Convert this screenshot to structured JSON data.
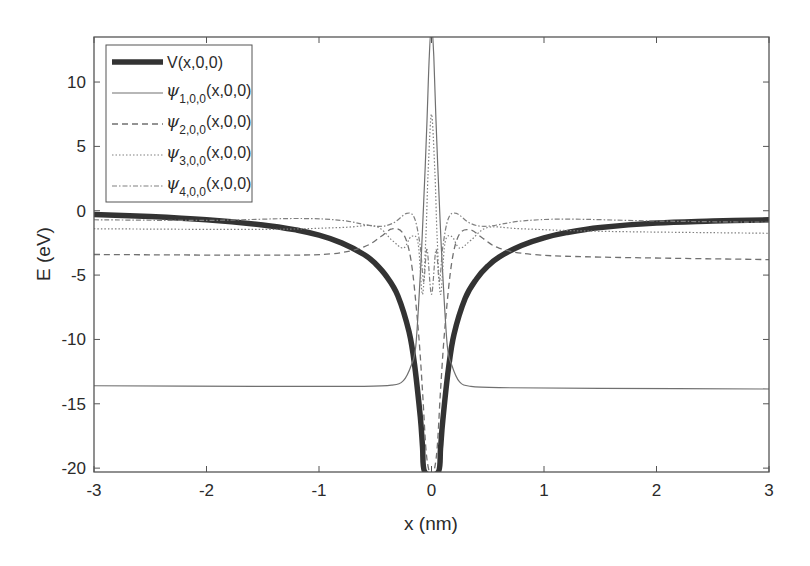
{
  "chart_data": {
    "type": "line",
    "title": "",
    "xlabel": "x (nm)",
    "ylabel": "E (eV)",
    "xlim": [
      -3,
      3
    ],
    "ylim": [
      -20.3,
      13.5
    ],
    "xticks": [
      -3,
      -2,
      -1,
      0,
      1,
      2,
      3
    ],
    "xtick_labels": [
      "-3",
      "-2",
      "-1",
      "0",
      "1",
      "2",
      "3"
    ],
    "yticks": [
      10,
      5,
      0,
      -5,
      -10,
      -15,
      -20
    ],
    "ytick_labels": [
      "10",
      "5",
      "0",
      "-5",
      "-10",
      "-15",
      "-20"
    ],
    "grid": false,
    "legend_position": "upper left",
    "series": [
      {
        "name": "V(x,0,0)",
        "legend_main": "V(x,0,0)",
        "style": "solid-thick",
        "color": "#333333",
        "x": [
          -3,
          -2.5,
          -2,
          -1.5,
          -1.2,
          -1.0,
          -0.8,
          -0.6,
          -0.5,
          -0.4,
          -0.3,
          -0.2,
          -0.15,
          -0.1,
          -0.08,
          -0.06,
          0.06,
          0.08,
          0.1,
          0.15,
          0.2,
          0.3,
          0.4,
          0.5,
          0.6,
          0.8,
          1.0,
          1.2,
          1.5,
          2,
          2.5,
          3
        ],
        "y": [
          -0.3,
          -0.45,
          -0.7,
          -1.1,
          -1.5,
          -1.9,
          -2.5,
          -3.4,
          -4.1,
          -5.1,
          -6.6,
          -9.4,
          -12.0,
          -16.0,
          -18.3,
          -20.3,
          -20.3,
          -18.5,
          -16.3,
          -12.3,
          -9.6,
          -6.8,
          -5.3,
          -4.3,
          -3.6,
          -2.7,
          -2.1,
          -1.7,
          -1.3,
          -0.95,
          -0.8,
          -0.7
        ]
      },
      {
        "name": "psi_1,0,0(x,0,0)",
        "legend_psi": "ψ",
        "legend_sub": "1,0,0",
        "legend_tail": "(x,0,0)",
        "style": "solid-thin",
        "color": "#707070",
        "x": [
          -3,
          -1.5,
          -0.6,
          -0.35,
          -0.25,
          -0.18,
          -0.14,
          -0.1,
          -0.07,
          -0.04,
          -0.02,
          0,
          0.02,
          0.04,
          0.07,
          0.1,
          0.14,
          0.18,
          0.25,
          0.35,
          0.6,
          1.5,
          3
        ],
        "y": [
          -13.6,
          -13.65,
          -13.65,
          -13.55,
          -13.2,
          -12.0,
          -10.5,
          -5.0,
          0.5,
          7.0,
          12.0,
          14.5,
          12.0,
          7.0,
          0.5,
          -5.0,
          -10.5,
          -12.0,
          -13.3,
          -13.65,
          -13.75,
          -13.8,
          -13.85
        ]
      },
      {
        "name": "psi_2,0,0(x,0,0)",
        "legend_psi": "ψ",
        "legend_sub": "2,0,0",
        "legend_tail": "(x,0,0)",
        "style": "dashed",
        "color": "#707070",
        "x": [
          -3,
          -1.5,
          -0.9,
          -0.6,
          -0.45,
          -0.35,
          -0.25,
          -0.18,
          -0.12,
          -0.08,
          -0.05,
          -0.02,
          0,
          0.02,
          0.05,
          0.08,
          0.12,
          0.18,
          0.25,
          0.35,
          0.45,
          0.6,
          0.9,
          1.5,
          3
        ],
        "y": [
          -3.4,
          -3.45,
          -3.35,
          -2.8,
          -2.0,
          -1.4,
          -1.8,
          -4.0,
          -9.0,
          -14.0,
          -18.5,
          -20.3,
          -20.3,
          -20.3,
          -18.5,
          -14.0,
          -9.0,
          -4.0,
          -1.8,
          -1.5,
          -2.1,
          -2.9,
          -3.4,
          -3.6,
          -3.8
        ]
      },
      {
        "name": "psi_3,0,0(x,0,0)",
        "legend_psi": "ψ",
        "legend_sub": "3,0,0",
        "legend_tail": "(x,0,0)",
        "style": "dotted",
        "color": "#808080",
        "x": [
          -3,
          -1.5,
          -0.8,
          -0.5,
          -0.35,
          -0.25,
          -0.18,
          -0.12,
          -0.08,
          -0.05,
          -0.03,
          0,
          0.03,
          0.05,
          0.08,
          0.12,
          0.18,
          0.25,
          0.35,
          0.5,
          0.8,
          1.5,
          3
        ],
        "y": [
          -1.4,
          -1.45,
          -1.3,
          -1.2,
          -2.3,
          -2.9,
          -2.0,
          -2.5,
          -6.5,
          -2.0,
          3.0,
          7.5,
          3.0,
          -2.0,
          -6.5,
          -2.5,
          -2.0,
          -2.9,
          -2.3,
          -1.3,
          -1.4,
          -1.6,
          -1.75
        ]
      },
      {
        "name": "psi_4,0,0(x,0,0)",
        "legend_psi": "ψ",
        "legend_sub": "4,0,0",
        "legend_tail": "(x,0,0)",
        "style": "dash-dot",
        "color": "#808080",
        "x": [
          -3,
          -2,
          -1.2,
          -0.8,
          -0.5,
          -0.35,
          -0.22,
          -0.15,
          -0.1,
          -0.07,
          -0.04,
          0,
          0.04,
          0.07,
          0.1,
          0.15,
          0.22,
          0.35,
          0.5,
          0.8,
          1.2,
          2,
          3
        ],
        "y": [
          -0.7,
          -0.75,
          -0.6,
          -0.75,
          -1.2,
          -1.0,
          -0.2,
          -0.6,
          -2.8,
          -5.5,
          -3.0,
          -6.5,
          -3.0,
          -5.5,
          -2.8,
          -0.6,
          -0.2,
          -1.0,
          -1.2,
          -0.8,
          -0.65,
          -0.8,
          -0.9
        ]
      }
    ]
  }
}
